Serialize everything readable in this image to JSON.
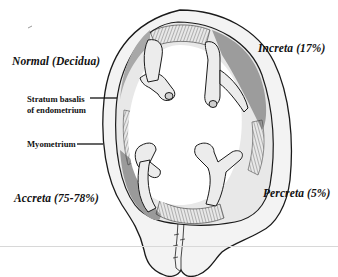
{
  "diagram": {
    "labels": {
      "normal": "Normal (Decidua)",
      "increta": "Increta (17%)",
      "stratum_line1": "Stratum basalis",
      "stratum_line2": "of endometrium",
      "myometrium": "Myometrium",
      "accreta": "Accreta (75-78%)",
      "percreta": "Percreta (5%)"
    },
    "regions": [
      {
        "name": "Normal (Decidua)",
        "position": "upper-left"
      },
      {
        "name": "Increta",
        "percent": 17,
        "position": "upper-right"
      },
      {
        "name": "Accreta",
        "percent_range": "75-78",
        "position": "lower-left"
      },
      {
        "name": "Percreta",
        "percent": 5,
        "position": "lower-right"
      }
    ],
    "colors": {
      "outline": "#1a1a1a",
      "myometrium_fill": "#f2f2f2",
      "invasion_shade": "#9a9a9a",
      "percreta_shade": "#8f8f8f",
      "cavity_fill": "#ffffff",
      "tissue_fill": "#e6e6e6"
    }
  }
}
